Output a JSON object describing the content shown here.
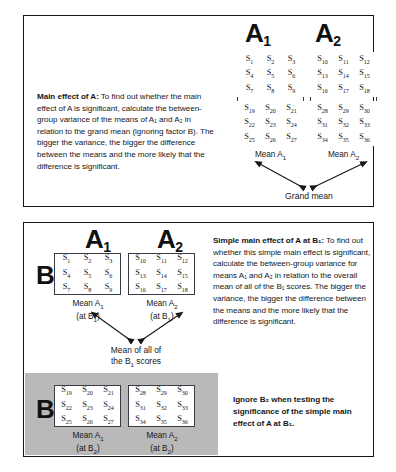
{
  "panel_main": {
    "name": "Main effect of A panel",
    "heading": "Main effect of A:",
    "body": " To find out whether the main effect of A is significant, calculate the between-group variance of the means of A₁ and A₂ in relation to the grand mean (ignoring factor B). The bigger the variance, the bigger the difference between the means and the more likely that the difference is significant.",
    "column_labels": [
      {
        "letter": "A",
        "subscript": "1"
      },
      {
        "letter": "A",
        "subscript": "2"
      }
    ],
    "groups": [
      {
        "column": "A1",
        "upper_rows": [
          [
            "S1",
            "S2",
            "S3"
          ],
          [
            "S4",
            "S5",
            "S6"
          ],
          [
            "S7",
            "S8",
            "S9"
          ]
        ],
        "lower_rows": [
          [
            "S19",
            "S20",
            "S21"
          ],
          [
            "S22",
            "S23",
            "S24"
          ],
          [
            "S25",
            "S26",
            "S27"
          ]
        ],
        "mean_label": "Mean A",
        "mean_subscript": "1"
      },
      {
        "column": "A2",
        "upper_rows": [
          [
            "S10",
            "S11",
            "S12"
          ],
          [
            "S13",
            "S14",
            "S15"
          ],
          [
            "S16",
            "S17",
            "S18"
          ]
        ],
        "lower_rows": [
          [
            "S28",
            "S29",
            "S30"
          ],
          [
            "S31",
            "S32",
            "S33"
          ],
          [
            "S34",
            "S35",
            "S36"
          ]
        ],
        "mean_label": "Mean A",
        "mean_subscript": "2"
      }
    ],
    "grand_mean_label": "Grand mean"
  },
  "panel_simple": {
    "name": "Simple main effect of A at B1 panel",
    "heading": "Simple main effect of A at B₁:",
    "body": " To find out whether this simple main effect is significant, calculate the between-group variance for means A₁ and A₂ in relation to the overall mean of all of the B₁ scores. The bigger the variance, the bigger the difference between the means and the more likely that the difference is significant.",
    "ignore_note": "Ignore B₂ when testing the significance of the simple main effect of A at B₁.",
    "column_labels": [
      {
        "letter": "A",
        "subscript": "1"
      },
      {
        "letter": "A",
        "subscript": "2"
      }
    ],
    "row_labels": [
      {
        "letter": "B",
        "subscript": "1"
      },
      {
        "letter": "B",
        "subscript": "2"
      }
    ],
    "cells": [
      {
        "row": "B1",
        "column": "A1",
        "rows": [
          [
            "S1",
            "S2",
            "S3"
          ],
          [
            "S4",
            "S5",
            "S6"
          ],
          [
            "S7",
            "S8",
            "S9"
          ]
        ],
        "mean_label": "Mean A",
        "mean_subscript": "1",
        "mean_at": "(at B",
        "mean_at_subscript": "1"
      },
      {
        "row": "B1",
        "column": "A2",
        "rows": [
          [
            "S10",
            "S11",
            "S12"
          ],
          [
            "S13",
            "S14",
            "S15"
          ],
          [
            "S16",
            "S17",
            "S18"
          ]
        ],
        "mean_label": "Mean A",
        "mean_subscript": "2",
        "mean_at": "(at B",
        "mean_at_subscript": "1"
      },
      {
        "row": "B2",
        "column": "A1",
        "rows": [
          [
            "S19",
            "S20",
            "S21"
          ],
          [
            "S22",
            "S23",
            "S24"
          ],
          [
            "S25",
            "S26",
            "S27"
          ]
        ],
        "mean_label": "Mean A",
        "mean_subscript": "1",
        "mean_at": "(at B",
        "mean_at_subscript": "2"
      },
      {
        "row": "B2",
        "column": "A2",
        "rows": [
          [
            "S28",
            "S29",
            "S30"
          ],
          [
            "S31",
            "S32",
            "S33"
          ],
          [
            "S34",
            "S35",
            "S36"
          ]
        ],
        "mean_label": "Mean A",
        "mean_subscript": "2",
        "mean_at": "(at B",
        "mean_at_subscript": "2"
      }
    ],
    "overall_mean_line1": "Mean of all of",
    "overall_mean_line2_pre": "the B",
    "overall_mean_line2_sub": "1",
    "overall_mean_line2_post": " scores"
  },
  "colors": {
    "ink": "#15161a",
    "border": "#3a3c42",
    "panel_border": "#15161a",
    "highlight_band": "#b9b9b9",
    "page_background": "#ffffff"
  }
}
